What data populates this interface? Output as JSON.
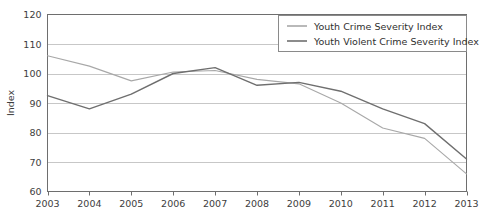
{
  "chart_data": {
    "type": "line",
    "title": "",
    "subtitle": "",
    "xlabel": "",
    "ylabel": "Index",
    "x": [
      2003,
      2004,
      2005,
      2006,
      2007,
      2008,
      2009,
      2010,
      2011,
      2012,
      2013
    ],
    "categories": [
      "2003",
      "2004",
      "2005",
      "2006",
      "2007",
      "2008",
      "2009",
      "2010",
      "2011",
      "2012",
      "2013"
    ],
    "xlim": [
      2003,
      2013
    ],
    "ylim": [
      60,
      120
    ],
    "yticks": [
      60,
      70,
      80,
      90,
      100,
      110,
      120
    ],
    "ytick_labels": [
      "60",
      "70",
      "80",
      "90",
      "100",
      "110",
      "120"
    ],
    "grid": "horizontal",
    "legend_position": "top-right",
    "series": [
      {
        "name": "Youth Crime Severity Index",
        "color": "#a8a8a8",
        "values": [
          106,
          102.5,
          97.5,
          100.5,
          101,
          98,
          96.5,
          90,
          81.5,
          78,
          66
        ]
      },
      {
        "name": "Youth Violent Crime Severity Index",
        "color": "#6f6f6f",
        "values": [
          92.5,
          88,
          93,
          100,
          102,
          96,
          97,
          94,
          88,
          83,
          71
        ]
      }
    ]
  },
  "legend": {
    "entries": [
      {
        "label": "Youth Crime Severity Index"
      },
      {
        "label": "Youth Violent Crime Severity Index"
      }
    ]
  },
  "axes": {
    "y_title": "Index",
    "y_tick_labels": [
      "120",
      "110",
      "100",
      "90",
      "80",
      "70",
      "60"
    ],
    "x_tick_labels": [
      "2003",
      "2004",
      "2005",
      "2006",
      "2007",
      "2008",
      "2009",
      "2010",
      "2011",
      "2012",
      "2013"
    ]
  },
  "colors": {
    "series_1": "#a8a8a8",
    "series_2": "#6f6f6f",
    "gridline": "#b9b9b9",
    "axis": "#6e6e6e",
    "text": "#3d3d3d",
    "background": "#ffffff"
  }
}
